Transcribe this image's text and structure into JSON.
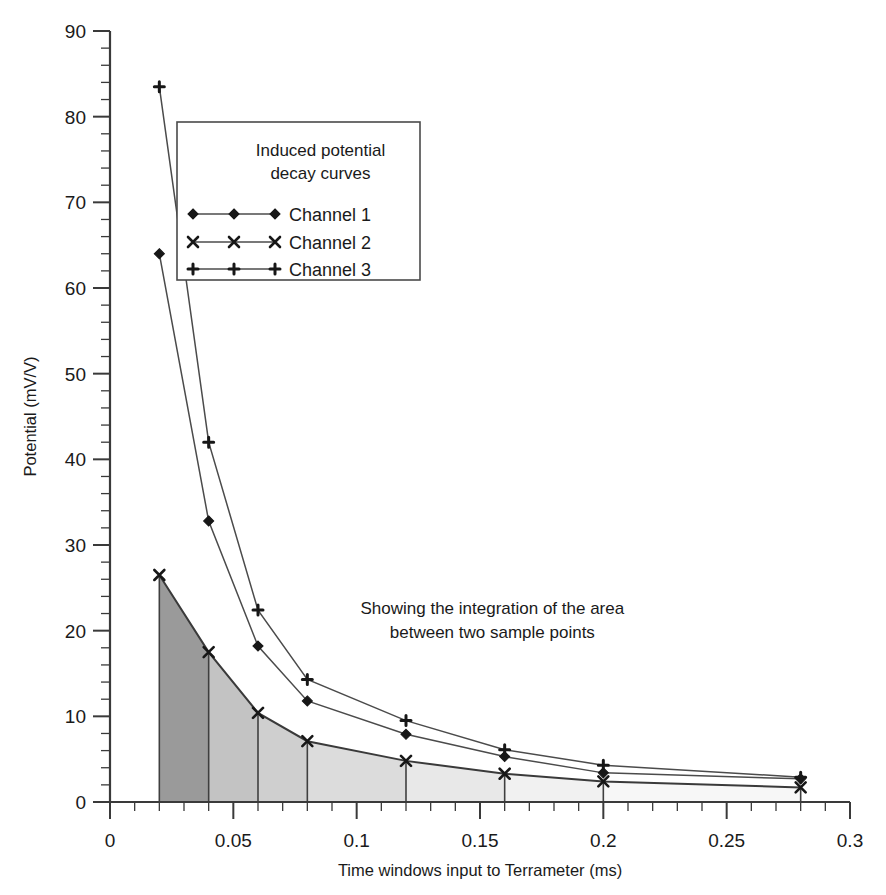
{
  "chart_data": {
    "type": "line",
    "title": "",
    "xlabel": "Time windows input to Terrameter (ms)",
    "ylabel": "Potential (mV/V)",
    "xlim": [
      0,
      0.3
    ],
    "ylim": [
      0,
      90
    ],
    "grid": false,
    "x_ticklabels": [
      "0",
      "0.05",
      "0.1",
      "0.15",
      "0.2",
      "0.25",
      "0.3"
    ],
    "x_tickvalues": [
      0,
      0.05,
      0.1,
      0.15,
      0.2,
      0.25,
      0.3
    ],
    "x_minor_step": 0.01,
    "y_ticklabels": [
      "0",
      "10",
      "20",
      "30",
      "40",
      "50",
      "60",
      "70",
      "80",
      "90"
    ],
    "y_tickvalues": [
      0,
      10,
      20,
      30,
      40,
      50,
      60,
      70,
      80,
      90
    ],
    "y_minor_step": 2,
    "x": [
      0.02,
      0.04,
      0.06,
      0.08,
      0.12,
      0.16,
      0.2,
      0.28
    ],
    "series": [
      {
        "name": "Channel 1",
        "marker": "diamond",
        "values": [
          64.0,
          32.8,
          18.2,
          11.8,
          7.9,
          5.3,
          3.4,
          2.7
        ]
      },
      {
        "name": "Channel 2",
        "marker": "cross",
        "values": [
          26.5,
          17.5,
          10.4,
          7.1,
          4.8,
          3.3,
          2.4,
          1.7
        ]
      },
      {
        "name": "Channel 3",
        "marker": "plus",
        "values": [
          83.5,
          42.0,
          22.4,
          14.3,
          9.5,
          6.1,
          4.3,
          2.9
        ]
      }
    ],
    "legend": {
      "position": "upper-left-inset",
      "title_line1": "Induced potential",
      "title_line2": "decay curves",
      "entries": [
        "Channel 1",
        "Channel 2",
        "Channel 3"
      ]
    },
    "annotations": [
      {
        "name": "integration-note",
        "line1": "Showing the integration of the area",
        "line2": "between two sample points",
        "x": 0.155,
        "y": 22.0
      }
    ],
    "shaded_bands": {
      "under_series": "Channel 2",
      "edges": [
        0.02,
        0.04,
        0.06,
        0.08,
        0.12,
        0.16,
        0.2,
        0.28
      ],
      "fills": [
        "#9a9a9a",
        "#c3c3c3",
        "#cfcfcf",
        "#dcdcdc",
        "#e8e8e8",
        "#f1f1f1",
        "#f7f7f7"
      ]
    },
    "colors": {
      "axis": "#3a3a3a",
      "line": "#4b4b4b",
      "marker": "#171717",
      "background": "#ffffff"
    }
  }
}
